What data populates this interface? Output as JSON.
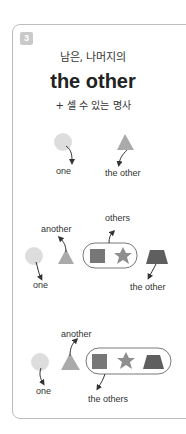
{
  "card": {
    "number": "3",
    "subtitle": "남은, 나머지의",
    "title": "the other",
    "note": "+ 셀 수 있는 명사"
  },
  "colors": {
    "circle": "#dddddd",
    "triangle": "#aaaaaa",
    "square": "#777777",
    "star": "#8e8e8e",
    "trapezoid": "#5f5f5f",
    "arrow": "#333333",
    "border": "#bdbdbd",
    "badge": "#c9c9c9"
  },
  "diagrams": [
    {
      "name": "two-items",
      "labels": {
        "one": "one",
        "the_other": "the other"
      }
    },
    {
      "name": "several-items-single-remaining",
      "labels": {
        "one": "one",
        "another": "another",
        "others": "others",
        "the_other": "the other"
      }
    },
    {
      "name": "several-items-group-remaining",
      "labels": {
        "one": "one",
        "another": "another",
        "the_others": "the others"
      }
    }
  ]
}
